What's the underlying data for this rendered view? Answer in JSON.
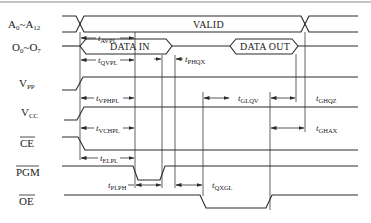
{
  "diagram": {
    "type": "timing-diagram",
    "signals": [
      {
        "id": "addr",
        "label_main": "A",
        "label_sub0": "0",
        "label_sep": "~A",
        "label_sub1": "12"
      },
      {
        "id": "data",
        "label_main": "O",
        "label_sub0": "0",
        "label_sep": "~O",
        "label_sub1": "7"
      },
      {
        "id": "vpp",
        "label_main": "V",
        "label_sub0": "PP"
      },
      {
        "id": "vcc",
        "label_main": "V",
        "label_sub0": "CC"
      },
      {
        "id": "ce",
        "label_main": "CE",
        "overbar": true
      },
      {
        "id": "pgm",
        "label_main": "PGM",
        "overbar": true
      },
      {
        "id": "oe",
        "label_main": "OE",
        "overbar": true
      }
    ],
    "bus_labels": {
      "valid": "VALID",
      "data_in": "DATA IN",
      "data_out": "DATA OUT"
    },
    "timing_params": [
      {
        "id": "tAVPL",
        "t": "t",
        "sub": "AVPL"
      },
      {
        "id": "tQVPL",
        "t": "t",
        "sub": "QVPL"
      },
      {
        "id": "tPHQX",
        "t": "t",
        "sub": "PHQX"
      },
      {
        "id": "tVPHPL",
        "t": "t",
        "sub": "VPHPL"
      },
      {
        "id": "tGLQV",
        "t": "t",
        "sub": "GLQV"
      },
      {
        "id": "tGHQZ",
        "t": "t",
        "sub": "GHQZ"
      },
      {
        "id": "tVCHPL",
        "t": "t",
        "sub": "VCHPL"
      },
      {
        "id": "tGHAX",
        "t": "t",
        "sub": "GHAX"
      },
      {
        "id": "tELPL",
        "t": "t",
        "sub": "ELPL"
      },
      {
        "id": "tPLPH",
        "t": "t",
        "sub": "PLPH"
      },
      {
        "id": "tQXGL",
        "t": "t",
        "sub": "QXGL"
      }
    ]
  }
}
